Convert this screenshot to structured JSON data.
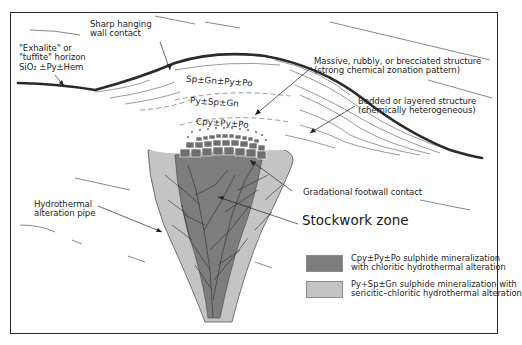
{
  "figure": {
    "labels": {
      "hanging_wall": [
        "Sharp hanging",
        "wall contact"
      ],
      "exhalite": [
        "\"Exhalite\" or",
        "\"tuffite\" horizon",
        "SiO₂ ±Py±Hem"
      ],
      "massive": [
        "Massive, rubbly, or brecciated structure",
        "(strong chemical zonation pattern)"
      ],
      "bedded": [
        "Bedded or layered structure",
        "(chemically heterogeneous)"
      ],
      "alteration_pipe": [
        "Hydrothermal",
        "alteration pipe"
      ],
      "footwall": "Gradational footwall contact",
      "stockwork": "Stockwork zone"
    },
    "zones": {
      "upper": "Sp±Gn±Py±Po",
      "middle": "Py±Sp±Gn",
      "lower": "Cpy±Py±Po"
    },
    "legend": [
      {
        "swatch_color": "#7d7d7d",
        "lines": [
          "Cpy±Py±Po sulphide mineralization",
          "with chloritic hydrothermal alteration"
        ]
      },
      {
        "swatch_color": "#c4c4c4",
        "lines": [
          "Py+Sp±Gn sulphide mineralization with",
          "sericitic–chloritic hydrothermal alteration"
        ]
      }
    ],
    "colors": {
      "dark_core": "#7d7d7d",
      "light_halo": "#c4c4c4",
      "contact_line": "#2a2a2a",
      "breccia_fill": "#6f6f6f"
    }
  }
}
